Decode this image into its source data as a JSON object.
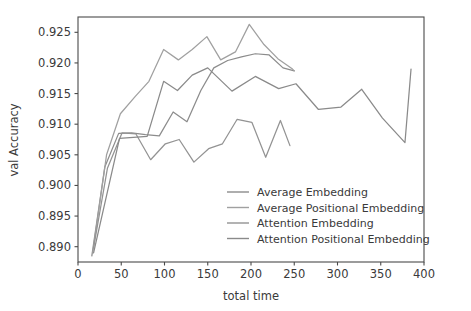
{
  "chart_data": {
    "type": "line",
    "title": "",
    "xlabel": "total time",
    "ylabel": "val Accuracy",
    "xlim": [
      0,
      400
    ],
    "ylim": [
      0.8875,
      0.9275
    ],
    "grid": false,
    "legend_position": "lower right",
    "xticks": [
      0,
      50,
      100,
      150,
      200,
      250,
      300,
      350,
      400
    ],
    "xtick_labels": [
      "0",
      "50",
      "100",
      "150",
      "200",
      "250",
      "300",
      "350",
      "400"
    ],
    "yticks": [
      0.89,
      0.895,
      0.9,
      0.905,
      0.91,
      0.915,
      0.92,
      0.925
    ],
    "ytick_labels": [
      "0.890",
      "0.895",
      "0.900",
      "0.905",
      "0.910",
      "0.915",
      "0.920",
      "0.925"
    ],
    "series": [
      {
        "name": "Average Embedding",
        "color": "#8c8c8c",
        "x": [
          16,
          31,
          47,
          62,
          78,
          94,
          110,
          126,
          142,
          157,
          173,
          189,
          205,
          221,
          237,
          250
        ],
        "y": [
          0.8885,
          0.903,
          0.9085,
          0.9086,
          0.9083,
          0.9081,
          0.912,
          0.9104,
          0.9155,
          0.9192,
          0.9204,
          0.921,
          0.9215,
          0.9213,
          0.9192,
          0.9187
        ]
      },
      {
        "name": "Average Positional Embedding",
        "color": "#a0a0a0",
        "x": [
          17,
          33,
          49,
          66,
          82,
          99,
          116,
          132,
          149,
          165,
          182,
          198,
          215,
          231,
          248,
          250
        ],
        "y": [
          0.889,
          0.905,
          0.9117,
          0.9145,
          0.917,
          0.9222,
          0.9205,
          0.9222,
          0.9243,
          0.9205,
          0.9218,
          0.9263,
          0.923,
          0.9207,
          0.919,
          0.9187
        ]
      },
      {
        "name": "Attention Embedding",
        "color": "#939393",
        "x": [
          18,
          34,
          51,
          67,
          84,
          101,
          117,
          134,
          151,
          167,
          184,
          201,
          217,
          234,
          245
        ],
        "y": [
          0.8898,
          0.9028,
          0.9086,
          0.9084,
          0.9042,
          0.9068,
          0.9075,
          0.9038,
          0.906,
          0.9068,
          0.9108,
          0.9103,
          0.9046,
          0.9106,
          0.9065
        ]
      },
      {
        "name": "Attention Positional Embedding",
        "color": "#8a8a8a",
        "x": [
          18,
          48,
          80,
          99,
          115,
          132,
          150,
          178,
          205,
          232,
          252,
          278,
          304,
          328,
          352,
          378,
          385
        ],
        "y": [
          0.889,
          0.9077,
          0.908,
          0.917,
          0.9155,
          0.918,
          0.9192,
          0.9154,
          0.9178,
          0.9158,
          0.9166,
          0.9124,
          0.9128,
          0.9157,
          0.911,
          0.907,
          0.919
        ]
      }
    ]
  },
  "axes": {
    "xlabel": "total time",
    "ylabel": "val Accuracy"
  },
  "legend": {
    "items": [
      {
        "label": "Average Embedding",
        "color": "#8c8c8c"
      },
      {
        "label": "Average Positional Embedding",
        "color": "#a0a0a0"
      },
      {
        "label": "Attention Embedding",
        "color": "#939393"
      },
      {
        "label": "Attention Positional Embedding",
        "color": "#8a8a8a"
      }
    ]
  }
}
